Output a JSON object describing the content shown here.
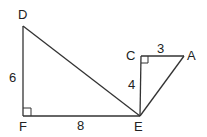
{
  "diagram": {
    "points": {
      "D": {
        "label": "D",
        "x": 23,
        "y": 26
      },
      "F": {
        "label": "F",
        "x": 23,
        "y": 116
      },
      "E": {
        "label": "E",
        "x": 140,
        "y": 116
      },
      "C": {
        "label": "C",
        "x": 141,
        "y": 56
      },
      "A": {
        "label": "A",
        "x": 184,
        "y": 56
      }
    },
    "segments": [
      {
        "from": "D",
        "to": "F",
        "length_label": "6"
      },
      {
        "from": "F",
        "to": "E",
        "length_label": "8"
      },
      {
        "from": "D",
        "to": "E"
      },
      {
        "from": "C",
        "to": "E",
        "length_label": "4"
      },
      {
        "from": "C",
        "to": "A",
        "length_label": "3"
      },
      {
        "from": "A",
        "to": "E"
      }
    ],
    "right_angles": [
      "F",
      "C"
    ],
    "labels": {
      "D": "D",
      "F": "F",
      "E": "E",
      "C": "C",
      "A": "A",
      "DF": "6",
      "FE": "8",
      "CE": "4",
      "CA": "3"
    }
  }
}
